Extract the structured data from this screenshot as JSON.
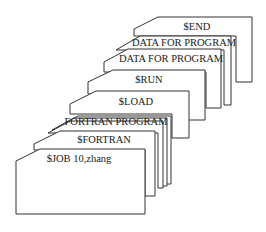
{
  "diagram": {
    "cards": [
      {
        "id": "end",
        "label": "$END"
      },
      {
        "id": "data2",
        "label": "DATA FOR PROGRAM"
      },
      {
        "id": "data1",
        "label": "DATA FOR PROGRAM"
      },
      {
        "id": "run",
        "label": "$RUN"
      },
      {
        "id": "load",
        "label": "$LOAD"
      },
      {
        "id": "fortran_program",
        "label": "FORTRAN PROGRAM"
      },
      {
        "id": "fortran",
        "label": "$FORTRAN"
      },
      {
        "id": "job",
        "label": "$JOB 10,zhang"
      }
    ]
  }
}
